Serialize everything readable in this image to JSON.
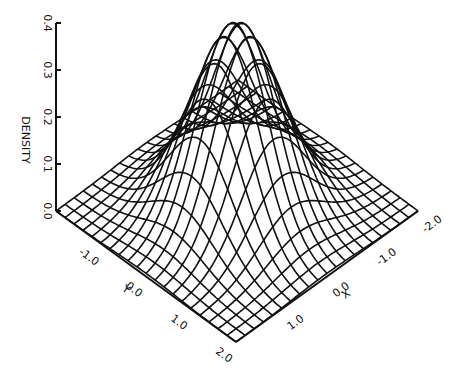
{
  "chart_data": {
    "type": "surface3d",
    "title": "",
    "xlabel": "X",
    "ylabel": "Y",
    "zlabel": "DENSITY",
    "x_ticks": [
      "-2.0",
      "-1.0",
      "0.0",
      "1.0"
    ],
    "y_ticks": [
      "-1.0",
      "0.0",
      "1.0",
      "2.0"
    ],
    "z_ticks": [
      "0.0",
      "0.1",
      "0.2",
      "0.3",
      "0.4"
    ],
    "x_range": [
      -2.0,
      2.0
    ],
    "y_range": [
      -2.0,
      2.0
    ],
    "z_range": [
      0.0,
      0.4
    ],
    "grid_lines_per_axis": 21,
    "surface": "bivariate normal density, peak at (0,0), wireframe mesh",
    "line_color": "#111111",
    "background": "#ffffff"
  }
}
